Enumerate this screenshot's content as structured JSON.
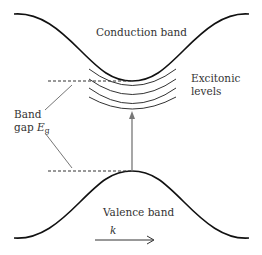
{
  "diagram": {
    "type": "band-structure",
    "labels": {
      "conduction_band": "Conduction band",
      "valence_band": "Valence band",
      "excitonic_line1": "Excitonic",
      "excitonic_line2": "levels",
      "band_gap_line1": "Band",
      "band_gap_line2_prefix": "gap ",
      "band_gap_symbol": "E",
      "band_gap_subscript": "g",
      "k_axis": "k"
    },
    "colors": {
      "band_curve": "#111111",
      "exciton_arcs": "#333333",
      "arrow": "#777777",
      "leader_lines": "#666666",
      "text": "#333333"
    },
    "excitonic_level_count": 4
  }
}
